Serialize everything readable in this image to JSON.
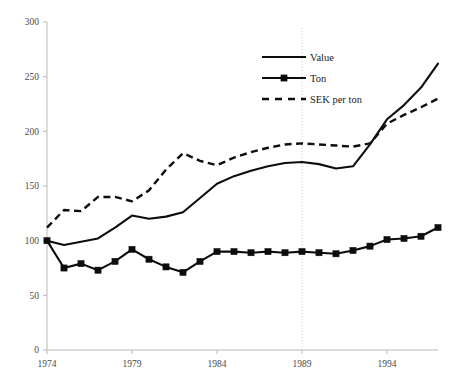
{
  "chart_data": {
    "type": "line",
    "title": "",
    "subtitle": "",
    "xlabel": "",
    "ylabel": "",
    "x": [
      1974,
      1975,
      1976,
      1977,
      1978,
      1979,
      1980,
      1981,
      1982,
      1983,
      1984,
      1985,
      1986,
      1987,
      1988,
      1989,
      1990,
      1991,
      1992,
      1993,
      1994,
      1995,
      1996,
      1997
    ],
    "xlim": [
      1974,
      1997
    ],
    "ylim": [
      0,
      300
    ],
    "y_ticks": [
      0,
      50,
      100,
      150,
      200,
      250,
      300
    ],
    "x_ticks": [
      1974,
      1979,
      1984,
      1989,
      1994
    ],
    "x_tick_labels": [
      "1974",
      "1979",
      "1984",
      "1989",
      "1994"
    ],
    "y_tick_labels": [
      "0",
      "50",
      "100",
      "150",
      "200",
      "250",
      "300"
    ],
    "grid": "vertical-dotted-at-1989",
    "legend_position": "upper-center",
    "series": [
      {
        "name": "Value",
        "style": "solid",
        "marker": "none",
        "color": "#0d0d0d",
        "values": [
          100,
          96,
          99,
          102,
          112,
          123,
          120,
          122,
          126,
          139,
          152,
          159,
          164,
          168,
          171,
          172,
          170,
          166,
          168,
          188,
          211,
          224,
          240,
          262
        ]
      },
      {
        "name": "Ton",
        "style": "solid",
        "marker": "square",
        "color": "#0d0d0d",
        "values": [
          100,
          75,
          79,
          73,
          81,
          92,
          83,
          76,
          71,
          81,
          90,
          90,
          89,
          90,
          89,
          90,
          89,
          88,
          91,
          95,
          101,
          102,
          104,
          112
        ]
      },
      {
        "name": "SEK per ton",
        "style": "dashed",
        "marker": "none",
        "color": "#0d0d0d",
        "values": [
          112,
          128,
          127,
          140,
          140,
          136,
          146,
          165,
          180,
          173,
          169,
          176,
          181,
          185,
          188,
          189,
          188,
          187,
          186,
          189,
          207,
          215,
          222,
          230
        ]
      }
    ],
    "legend": [
      {
        "label": "Value",
        "style": "solid",
        "marker": "none"
      },
      {
        "label": "Ton",
        "style": "solid",
        "marker": "square"
      },
      {
        "label": "SEK per ton",
        "style": "dashed",
        "marker": "none"
      }
    ],
    "colors": {
      "line": "#0d0d0d",
      "axis": "#b9b9b9",
      "grid": "#cfcfcf",
      "text": "#4a4a4a",
      "background": "#ffffff"
    }
  }
}
